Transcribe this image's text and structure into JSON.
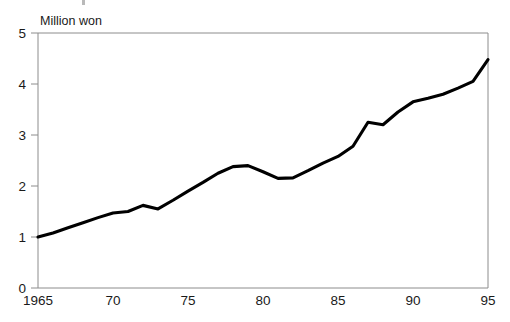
{
  "chart_data": {
    "type": "line",
    "title": "",
    "subtitle": "",
    "xlabel": "",
    "ylabel": "Million won",
    "ylabel_position": "top-left-inside",
    "xlim": [
      1965,
      1995
    ],
    "ylim": [
      0,
      5
    ],
    "ytick_values": [
      0,
      1,
      2,
      3,
      4,
      5
    ],
    "ytick_labels": [
      "0",
      "1",
      "2",
      "3",
      "4",
      "5"
    ],
    "xtick_values": [
      1965,
      1970,
      1975,
      1980,
      1985,
      1990,
      1995
    ],
    "xtick_labels": [
      "1965",
      "70",
      "75",
      "80",
      "85",
      "90",
      "95"
    ],
    "grid": false,
    "legend": false,
    "legend_position": "none",
    "line_color": "#000000",
    "line_width_px": 3,
    "frame_color": "#8c8c8c",
    "series": [
      {
        "name": "Million won",
        "x": [
          1965,
          1966,
          1967,
          1968,
          1969,
          1970,
          1971,
          1972,
          1973,
          1974,
          1975,
          1976,
          1977,
          1978,
          1979,
          1980,
          1981,
          1982,
          1983,
          1984,
          1985,
          1986,
          1987,
          1988,
          1989,
          1990,
          1991,
          1992,
          1993,
          1994,
          1995
        ],
        "values": [
          1.0,
          1.08,
          1.18,
          1.28,
          1.38,
          1.47,
          1.5,
          1.62,
          1.55,
          1.72,
          1.9,
          2.07,
          2.25,
          2.38,
          2.4,
          2.28,
          2.15,
          2.16,
          2.3,
          2.45,
          2.58,
          2.78,
          3.25,
          3.2,
          3.45,
          3.65,
          3.72,
          3.8,
          3.92,
          4.05,
          4.48
        ]
      }
    ],
    "annotations": []
  },
  "figure": {
    "y_axis_caption": "Million won"
  }
}
